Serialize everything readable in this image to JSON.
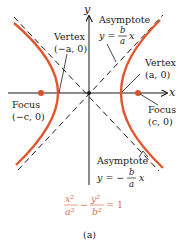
{
  "figure": {
    "caption": "(a)",
    "colors": {
      "curve": "#e2562f",
      "focus_dot": "#d9502c",
      "axis": "#1a1a1a",
      "asymptote": "#1a1a1a",
      "equation": "#e0704f"
    },
    "axes": {
      "x_label": "x",
      "y_label": "y"
    },
    "labels": {
      "asymptote_top_title": "Asymptote",
      "asymptote_top_eq_lhs": "y =",
      "asymptote_top_eq_num": "b",
      "asymptote_top_eq_den": "a",
      "asymptote_top_eq_var": "x",
      "asymptote_bottom_title": "Asymptote",
      "asymptote_bottom_eq_lhs": "y = −",
      "asymptote_bottom_eq_num": "b",
      "asymptote_bottom_eq_den": "a",
      "asymptote_bottom_eq_var": "x",
      "vertex_left_title": "Vertex",
      "vertex_left_coords": "(−a, 0)",
      "vertex_right_title": "Vertex",
      "vertex_right_coords": "(a, 0)",
      "focus_left_title": "Focus",
      "focus_left_coords": "(−c, 0)",
      "focus_right_title": "Focus",
      "focus_right_coords": "(c, 0)"
    },
    "equation": {
      "term1_num": "x²",
      "term1_den": "a²",
      "minus": "−",
      "term2_num": "y²",
      "term2_den": "b²",
      "rhs": "= 1"
    }
  }
}
